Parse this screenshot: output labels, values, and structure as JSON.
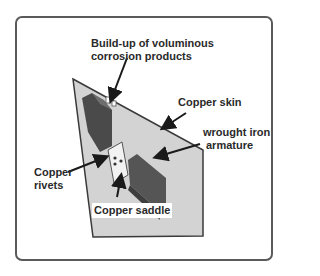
{
  "diagram": {
    "labels": {
      "corrosion_line1": "Build-up of voluminous",
      "corrosion_line2": "corrosion products",
      "copper_skin": "Copper skin",
      "armature_line1": "wrought iron",
      "armature_line2": "armature",
      "rivets_line1": "Copper",
      "rivets_line2": "rivets",
      "saddle": "Copper saddle"
    },
    "colors": {
      "panel_fill": "#d3d3d3",
      "panel_edge": "#3a3a3a",
      "iron_dark": "#4a4a4a",
      "iron_mid": "#6e6e6e",
      "frame_border": "#5a5a5a",
      "text": "#2a2a2a"
    }
  }
}
